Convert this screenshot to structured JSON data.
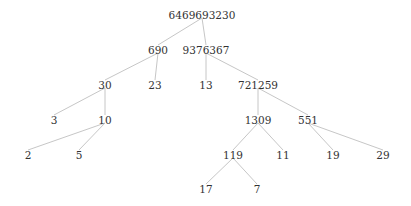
{
  "diagram": {
    "type": "factor-tree",
    "nodes": [
      {
        "id": "n0",
        "label": "6469693230",
        "x": 202,
        "y": 16
      },
      {
        "id": "n1",
        "label": "690",
        "x": 158,
        "y": 51
      },
      {
        "id": "n2",
        "label": "9376367",
        "x": 206,
        "y": 51
      },
      {
        "id": "n3",
        "label": "30",
        "x": 105,
        "y": 86
      },
      {
        "id": "n4",
        "label": "23",
        "x": 155,
        "y": 86
      },
      {
        "id": "n5",
        "label": "13",
        "x": 206,
        "y": 86
      },
      {
        "id": "n6",
        "label": "721259",
        "x": 258,
        "y": 86
      },
      {
        "id": "n7",
        "label": "3",
        "x": 54,
        "y": 121
      },
      {
        "id": "n8",
        "label": "10",
        "x": 105,
        "y": 121
      },
      {
        "id": "n9",
        "label": "1309",
        "x": 258,
        "y": 121
      },
      {
        "id": "n10",
        "label": "551",
        "x": 308,
        "y": 121
      },
      {
        "id": "n11",
        "label": "2",
        "x": 28,
        "y": 156
      },
      {
        "id": "n12",
        "label": "5",
        "x": 79,
        "y": 156
      },
      {
        "id": "n13",
        "label": "119",
        "x": 233,
        "y": 156
      },
      {
        "id": "n14",
        "label": "11",
        "x": 283,
        "y": 156
      },
      {
        "id": "n15",
        "label": "19",
        "x": 333,
        "y": 156
      },
      {
        "id": "n16",
        "label": "29",
        "x": 383,
        "y": 156
      },
      {
        "id": "n17",
        "label": "17",
        "x": 206,
        "y": 190
      },
      {
        "id": "n18",
        "label": "7",
        "x": 257,
        "y": 190
      }
    ],
    "edges": [
      [
        "n0",
        "n1"
      ],
      [
        "n0",
        "n2"
      ],
      [
        "n1",
        "n3"
      ],
      [
        "n1",
        "n4"
      ],
      [
        "n2",
        "n5"
      ],
      [
        "n2",
        "n6"
      ],
      [
        "n3",
        "n7"
      ],
      [
        "n3",
        "n8"
      ],
      [
        "n8",
        "n11"
      ],
      [
        "n8",
        "n12"
      ],
      [
        "n6",
        "n9"
      ],
      [
        "n6",
        "n10"
      ],
      [
        "n9",
        "n13"
      ],
      [
        "n9",
        "n14"
      ],
      [
        "n10",
        "n15"
      ],
      [
        "n10",
        "n16"
      ],
      [
        "n13",
        "n17"
      ],
      [
        "n13",
        "n18"
      ]
    ]
  }
}
